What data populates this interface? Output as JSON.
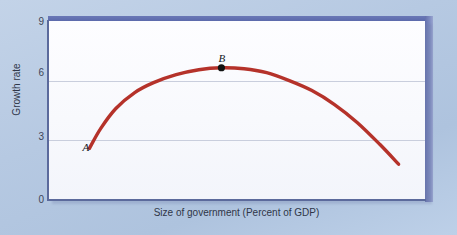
{
  "chart_data": {
    "type": "line",
    "title": "",
    "subtitle": "",
    "xlabel": "Size of government (Percent of GDP)",
    "ylabel": "Growth rate",
    "grid": true,
    "legend": "none",
    "xlim": [
      0,
      100
    ],
    "ylim": [
      0,
      9
    ],
    "xticks": [],
    "yticks": [
      "0",
      "3",
      "6",
      "9"
    ],
    "ytick_values": [
      0,
      3,
      6,
      9
    ],
    "series": [
      {
        "name": "Growth rate curve",
        "color": "#b5322a",
        "x": [
          11,
          14,
          18,
          23,
          28,
          34,
          40,
          46,
          52,
          58,
          64,
          70,
          76,
          82,
          88,
          93
        ],
        "values": [
          2.6,
          3.6,
          4.6,
          5.4,
          5.9,
          6.3,
          6.55,
          6.65,
          6.6,
          6.4,
          6.0,
          5.5,
          4.8,
          3.9,
          2.8,
          1.8
        ]
      }
    ],
    "annotations": [
      {
        "label": "A",
        "name": "point-a",
        "x": 11,
        "y": 2.6,
        "marker": "none",
        "note": "start of curve, low government size"
      },
      {
        "label": "B",
        "name": "point-b",
        "x": 46,
        "y": 6.65,
        "marker": "dot",
        "marker_color": "#111111",
        "note": "peak of curve, growth-maximizing size of government"
      }
    ]
  },
  "colors": {
    "page_background": "#b8cce4",
    "panel_background": "#fbfcff",
    "band": "#5c6aac",
    "axis": "#5b6a9c",
    "gridline": "#c9cedd",
    "curve": "#b5322a",
    "marker": "#111111",
    "tick_text": "#3d4558"
  }
}
